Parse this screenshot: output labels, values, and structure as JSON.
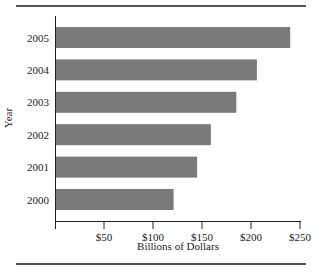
{
  "chart_data": {
    "type": "bar",
    "orientation": "horizontal",
    "title": "",
    "xlabel": "Billions of Dollars",
    "ylabel": "Year",
    "categories": [
      "2005",
      "2004",
      "2003",
      "2002",
      "2001",
      "2000"
    ],
    "values": [
      239,
      205,
      184,
      158,
      144,
      120
    ],
    "xlim": [
      0,
      250
    ],
    "xticks": [
      50,
      100,
      150,
      200,
      250
    ],
    "xtick_labels": [
      "$50",
      "$100",
      "$150",
      "$200",
      "$250"
    ],
    "grid": false,
    "legend": null,
    "bar_color": "#7a7a7a"
  }
}
